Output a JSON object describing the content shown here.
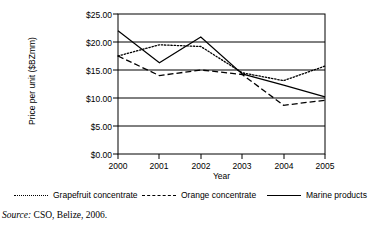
{
  "chart_data": {
    "type": "line",
    "title": "",
    "xlabel": "Year",
    "ylabel": "Price per unit ($BZmm)",
    "categories": [
      "2000",
      "2001",
      "2002",
      "2003",
      "2004",
      "2005"
    ],
    "x": [
      2000,
      2001,
      2002,
      2003,
      2004,
      2005
    ],
    "xlim": [
      2000,
      2005
    ],
    "ylim": [
      0,
      25
    ],
    "ytick_values": [
      0,
      5,
      10,
      15,
      20,
      25
    ],
    "ytick_labels": [
      "$0.00",
      "$5.00",
      "$10.00",
      "$15.00",
      "$20.00",
      "$25.00"
    ],
    "grid": "horizontal",
    "legend_position": "bottom",
    "series": [
      {
        "name": "Grapefruit concentrate",
        "style": "dotted",
        "color": "#000000",
        "values": [
          17.5,
          19.5,
          19.2,
          14.5,
          13.1,
          15.7
        ]
      },
      {
        "name": "Orange concentrate",
        "style": "dashed",
        "color": "#000000",
        "values": [
          17.5,
          14.0,
          15.0,
          14.2,
          8.7,
          9.6
        ]
      },
      {
        "name": "Marine products",
        "style": "solid",
        "color": "#000000",
        "values": [
          22.0,
          16.3,
          20.9,
          14.3,
          12.3,
          10.2
        ]
      }
    ]
  },
  "legend": {
    "items": [
      {
        "label": "Grapefruit concentrate",
        "style": "dotted"
      },
      {
        "label": "Orange concentrate",
        "style": "dashed"
      },
      {
        "label": "Marine products",
        "style": "solid"
      }
    ]
  },
  "source": {
    "label": "Source:",
    "text": "CSO, Belize, 2006."
  }
}
